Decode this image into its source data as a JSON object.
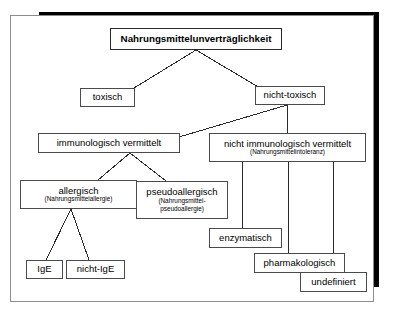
{
  "diagram": {
    "title": "Nahrungsmittelunverträglichkeit",
    "type": "hierarchy-tree",
    "language": "de",
    "nodes": {
      "root": {
        "label": "Nahrungsmittelunverträglichkeit",
        "subtitle": ""
      },
      "toxisch": {
        "label": "toxisch",
        "subtitle": ""
      },
      "nicht_toxisch": {
        "label": "nicht-toxisch",
        "subtitle": ""
      },
      "immunologisch": {
        "label": "immunologisch vermittelt",
        "subtitle": ""
      },
      "nicht_immunologisch": {
        "label": "nicht immunologisch vermittelt",
        "subtitle": "(Nahrungsmittelintoleranz)"
      },
      "allergisch": {
        "label": "allergisch",
        "subtitle": "(Nahrungsmittelallergie)"
      },
      "pseudoallergisch": {
        "label": "pseudoallergisch",
        "subtitle_line1": "(Nahrungsmittel-",
        "subtitle_line2": "pseudoallergie)"
      },
      "ige": {
        "label": "IgE",
        "subtitle": ""
      },
      "nicht_ige": {
        "label": "nicht-IgE",
        "subtitle": ""
      },
      "enzymatisch": {
        "label": "enzymatisch",
        "subtitle": ""
      },
      "pharmakologisch": {
        "label": "pharmakologisch",
        "subtitle": ""
      },
      "undefiniert": {
        "label": "undefiniert",
        "subtitle": ""
      }
    },
    "colors": {
      "background": "#ffffff",
      "box_border": "#4a4a4a",
      "frame_border": "#8d8d8d",
      "shadow": "#000000",
      "connector": "#2a2a2a",
      "text": "#000000"
    }
  }
}
